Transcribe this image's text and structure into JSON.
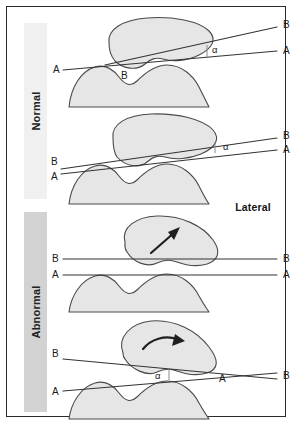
{
  "figure": {
    "view_label": "Lateral",
    "groups": [
      {
        "id": "normal",
        "label": "Normal",
        "band_color": "#f0f0f0"
      },
      {
        "id": "abnormal",
        "label": "Abnormal",
        "band_color": "#d2d2d2"
      }
    ],
    "colors": {
      "bone_fill": "#e6e6e6",
      "bone_stroke": "#4a4a4a",
      "line": "#333333",
      "frame": "#2b2b2b",
      "arrow": "#1f1f1f"
    },
    "panels": [
      {
        "id": "panel-1",
        "group": "Normal",
        "labels": {
          "line_a_left": "A",
          "line_a_right": "A",
          "line_b_left": "B",
          "line_b_right": "B",
          "angle": "α"
        },
        "description": "Normal patellofemoral alignment; lines A-A and B-B diverge with small angle alpha, patella centered on condyles"
      },
      {
        "id": "panel-2",
        "group": "Normal",
        "labels": {
          "line_a_left": "A",
          "line_a_right": "A",
          "line_b_left": "B",
          "line_b_right": "B",
          "angle": "α"
        },
        "description": "Normal variant; lines A-A and B-B converge at left forming narrow angle alpha opening to the right"
      },
      {
        "id": "panel-3",
        "group": "Abnormal",
        "labels": {
          "line_a_left": "A",
          "line_a_right": "A",
          "line_b_left": "B",
          "line_b_right": "B",
          "angle": ""
        },
        "arrow": "straight-arrow-up-right",
        "description": "Abnormal; lines A-A and B-B are parallel, patella tilted with arrow indicating displacement"
      },
      {
        "id": "panel-4",
        "group": "Abnormal",
        "labels": {
          "line_a_left": "A",
          "line_a_right": "A",
          "line_b_left": "B",
          "line_b_right": "B",
          "angle": "α"
        },
        "arrow": "curved-arrow-up-right",
        "description": "Abnormal; lines A-A and B-B cross producing reversed angle alpha, curved arrow shows patellar rotation"
      }
    ]
  }
}
